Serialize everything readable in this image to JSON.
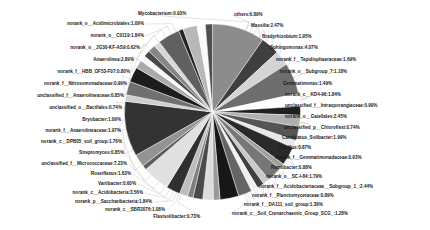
{
  "chart_data": {
    "type": "pie",
    "title": "",
    "xlabel": "",
    "ylabel": "",
    "legend_position": "none",
    "grid": false,
    "label_format": "name:percent",
    "palette": "grayscale",
    "categories": [
      "others",
      "Massilia",
      "Bradyrhizobium",
      "Sphingomonas",
      "norank_f__Tepidisphaeraceae",
      "norank_o__Subgroup_7",
      "Gemmatimonas",
      "norank_c__KD4-96",
      "unclassified_f__Intrasporangiaceae",
      "norank_o__Gaiellales",
      "unclassified_p__Chloroflexi",
      "Candidatus_Solibacter",
      "Bacillus",
      "norank_f__Gemmatimonadaceae",
      "Ramlibacter",
      "norank_o__SC-I-84",
      "norank_f__Acidobacteriaceae__Subgroup_1_",
      "norank_f__Planctomycetaceae",
      "norank_f__DA111_soil_group",
      "norank_c__Soil_Crenarchaeotic_Group_SCG_",
      "Flavisolibacter",
      "norank_c__SBR2076",
      "norank_p__Saccharibacteria",
      "norank_c__Acidobacteria",
      "Variibacter",
      "Roseiflexus",
      "unclassified_f__Micrococcaceae",
      "Streptomyces",
      "norank_c__DPB05_soil_group",
      "norank_f__Anaerolineaceae",
      "Bryobacter",
      "unclassified_o__Bacillales",
      "unclassified_f__Anaerolineaceae",
      "norank_f__Nitrosomonadaceae",
      "norank_f__HBB_OF53-F07",
      "Anaerolinea",
      "norank_o__JG30-KF-AS9",
      "norank_o__C0119",
      "norank_o__Acidimicrobiales",
      "Mycobacterium"
    ],
    "values": [
      6.89,
      2.47,
      1.95,
      4.07,
      1.69,
      1.18,
      1.49,
      1.84,
      0.99,
      2.45,
      0.74,
      1.99,
      0.87,
      0.93,
      0.88,
      1.79,
      2.44,
      0.89,
      1.36,
      1.28,
      0.73,
      1.08,
      1.84,
      3.56,
      0.6,
      1.63,
      7.23,
      0.85,
      1.76,
      1.97,
      1.09,
      0.74,
      0.85,
      0.99,
      0.8,
      2.89,
      0.62,
      1.84,
      1.09,
      0.93
    ],
    "labels": [
      "others:6.89%",
      "Massilia:2.47%",
      "Bradyrhizobium:1.95%",
      "Sphingomonas:4.07%",
      "norank_f__Tepidisphaeraceae:1.69%",
      "norank_o__Subgroup_7:1.18%",
      "Gemmatimonas:1.49%",
      "norank_c__KD4-96:1.84%",
      "unclassified_f__Intrasporangiaceae:0.99%",
      "norank_o__Gaiellales:2.45%",
      "unclassified_p__Chloroflexi:0.74%",
      "Candidatus_Solibacter:1.99%",
      "Bacillus:0.87%",
      "norank_f__Gemmatimonadaceae:0.93%",
      "Ramlibacter:0.88%",
      "norank_o__SC-I-84:1.79%",
      "norank_f__Acidobacteriaceae__Subgroup_1_:2.44%",
      "norank_f__Planctomycetaceae:0.89%",
      "norank_f__DA111_soil_group:1.36%",
      "norank_c__Soil_Crenarchaeotic_Group_SCG_:1.28%",
      "Flavisolibacter:0.73%",
      "norank_c__SBR2076:1.08%",
      "norank_p__Saccharibacteria:1.84%",
      "norank_c__Acidobacteria:3.56%",
      "Variibacter:0.60%",
      "Roseiflexus:1.63%",
      "unclassified_f__Micrococcaceae:7.23%",
      "Streptomyces:0.85%",
      "norank_c__DPB05_soil_group:1.76%",
      "norank_f__Anaerolineaceae:1.97%",
      "Bryobacter:1.09%",
      "unclassified_o__Bacillales:0.74%",
      "unclassified_f__Anaerolineaceae:0.85%",
      "norank_f__Nitrosomonadaceae:0.99%",
      "norank_f__HBB_OF53-F07:0.80%",
      "Anaerolinea:2.89%",
      "norank_o__JG30-KF-AS9:0.62%",
      "norank_o__C0119:1.84%",
      "norank_o__Acidimicrobiales:1.09%",
      "Mycobacterium:0.93%"
    ],
    "colors": [
      "#8c8c8c",
      "#3f3f3f",
      "#d4d4d4",
      "#6e6e6e",
      "#ffffff",
      "#1f1f1f",
      "#b0b0b0",
      "#555555",
      "#e8e8e8",
      "#2a2a2a",
      "#a0a0a0",
      "#777777",
      "#c8c8c8",
      "#404040",
      "#f0f0f0",
      "#656565",
      "#171717",
      "#9a9a9a",
      "#dcdcdc",
      "#4a4a4a",
      "#7f7f7f",
      "#bdbdbd",
      "#2f2f2f",
      "#e0e0e0",
      "#5c5c5c",
      "#939393",
      "#333333",
      "#cfcfcf",
      "#707070",
      "#1c1c1c",
      "#aaaaaa",
      "#f6f6f6",
      "#484848",
      "#868686",
      "#d8d8d8",
      "#606060",
      "#242424",
      "#b8b8b8",
      "#fafafa",
      "#4f4f4f"
    ]
  },
  "labels_left": [
    {
      "text": "norank_o__Acidimicrobiales:1.09%",
      "x": 144,
      "y": 24
    },
    {
      "text": "norank_o__C0119:1.84%",
      "x": 144,
      "y": 36
    },
    {
      "text": "norank_o__JG30-KF-AS9:0.62%",
      "x": 140,
      "y": 48
    },
    {
      "text": "Anaerolinea:2.89%",
      "x": 134,
      "y": 60
    },
    {
      "text": "norank_f__HBB_OF53-F07:0.80%",
      "x": 130,
      "y": 72
    },
    {
      "text": "norank_f__Nitrosomonadaceae:0.99%",
      "x": 127,
      "y": 84
    },
    {
      "text": "unclassified_f__Anaerolineaceae:0.85%",
      "x": 124,
      "y": 96
    },
    {
      "text": "unclassified_o__Bacillales:0.74%",
      "x": 122,
      "y": 108
    },
    {
      "text": "Bryobacter:1.09%",
      "x": 121,
      "y": 120
    },
    {
      "text": "norank_f__Anaerolineaceae:1.97%",
      "x": 121,
      "y": 131
    },
    {
      "text": "norank_c__DPB05_soil_group:1.76%",
      "x": 122,
      "y": 142
    },
    {
      "text": "Streptomyces:0.85%",
      "x": 124,
      "y": 153
    },
    {
      "text": "unclassified_f__Micrococcaceae:7.23%",
      "x": 127,
      "y": 164
    },
    {
      "text": "Roseiflexus:1.63%",
      "x": 131,
      "y": 174
    },
    {
      "text": "Variibacter:0.60%",
      "x": 136,
      "y": 184
    },
    {
      "text": "norank_c__Acidobacteria:3.56%",
      "x": 143,
      "y": 193
    },
    {
      "text": "norank_p__Saccharibacteria:1.84%",
      "x": 152,
      "y": 202
    },
    {
      "text": "norank_c__SBR2076:1.08%",
      "x": 165,
      "y": 210
    },
    {
      "text": "Flavisolibacter:0.73%",
      "x": 200,
      "y": 217
    }
  ],
  "labels_right": [
    {
      "text": "Mycobacterium:0.93%",
      "x": 138,
      "y": 14
    },
    {
      "text": "others:6.89%",
      "x": 234,
      "y": 15
    },
    {
      "text": "Massilia:2.47%",
      "x": 251,
      "y": 26
    },
    {
      "text": "Bradyrhizobium:1.95%",
      "x": 262,
      "y": 37
    },
    {
      "text": "Sphingomonas:4.07%",
      "x": 270,
      "y": 48
    },
    {
      "text": "norank_f__Tepidisphaeraceae:1.69%",
      "x": 276,
      "y": 60
    },
    {
      "text": "norank_o__Subgroup_7:1.18%",
      "x": 280,
      "y": 72
    },
    {
      "text": "Gemmatimonas:1.49%",
      "x": 283,
      "y": 84
    },
    {
      "text": "norank_c__KD4-96:1.84%",
      "x": 285,
      "y": 95
    },
    {
      "text": "unclassified_f__Intrasporangiaceae:0.99%",
      "x": 285,
      "y": 106
    },
    {
      "text": "norank_o__Gaiellales:2.45%",
      "x": 285,
      "y": 117
    },
    {
      "text": "unclassified_p__Chloroflexi:0.74%",
      "x": 284,
      "y": 128
    },
    {
      "text": "Candidatus_Solibacter:1.99%",
      "x": 282,
      "y": 138
    },
    {
      "text": "Bacillus:0.87%",
      "x": 279,
      "y": 148
    },
    {
      "text": "norank_f__Gemmatimonadaceae:0.93%",
      "x": 275,
      "y": 158
    },
    {
      "text": "Ramlibacter:0.88%",
      "x": 271,
      "y": 168
    },
    {
      "text": "norank_o__SC-I-84:1.79%",
      "x": 266,
      "y": 177
    },
    {
      "text": "norank_f__Acidobacteriaceae__Subgroup_1_:2.44%",
      "x": 259,
      "y": 187
    },
    {
      "text": "norank_f__Planctomycetaceae:0.89%",
      "x": 252,
      "y": 196
    },
    {
      "text": "norank_f__DA111_soil_group:1.36%",
      "x": 244,
      "y": 205
    },
    {
      "text": "norank_c__Soil_Crenarchaeotic_Group_SCG_:1.28%",
      "x": 232,
      "y": 214
    }
  ]
}
